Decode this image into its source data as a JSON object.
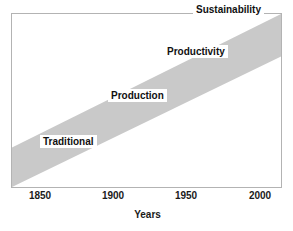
{
  "chart_data": {
    "type": "area",
    "title": "",
    "subtitle": "",
    "xlabel": "Years",
    "ylabel": "",
    "xlim": [
      1835,
      2015
    ],
    "grid": false,
    "legend": "none",
    "xticks": [
      "1850",
      "1900",
      "1950",
      "2000"
    ],
    "xtick_values": [
      1850,
      1900,
      1950,
      2000
    ],
    "band": {
      "name": "development-band",
      "color": "#c9c9c9",
      "description": "diagonal rising band from bottom-left to top-right",
      "lower_edge": [
        [
          1835,
          0.0
        ],
        [
          2015,
          0.755
        ]
      ],
      "upper_edge": [
        [
          1835,
          0.228
        ],
        [
          2015,
          1.0
        ]
      ]
    },
    "annotations": [
      {
        "label": "Traditional",
        "x": 1861,
        "y": 0.2
      },
      {
        "label": "Production",
        "x": 1908,
        "y": 0.42
      },
      {
        "label": "Productivity",
        "x": 1946,
        "y": 0.67
      },
      {
        "label": "Sustainability",
        "x": 1966,
        "y": 0.91
      }
    ],
    "colors": {
      "band": "#c9c9c9",
      "frame": "#b3b3b3",
      "text": "#111111",
      "background": "#ffffff",
      "label_box": "#ffffff"
    }
  },
  "figure": {
    "axis_title": "Years",
    "ticks": {
      "t1": "1850",
      "t2": "1900",
      "t3": "1950",
      "t4": "2000"
    },
    "labels": {
      "traditional": "Traditional",
      "production": "Production",
      "productivity": "Productivity",
      "sustainability": "Sustainability"
    }
  }
}
